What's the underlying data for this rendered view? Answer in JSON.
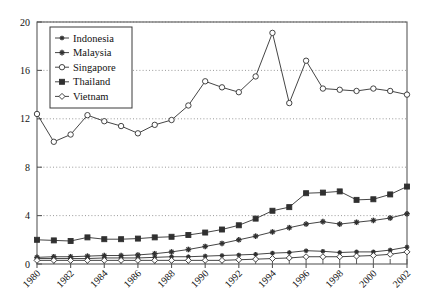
{
  "chart_data": {
    "type": "line",
    "title": "",
    "xlabel": "",
    "ylabel": "",
    "xlim": [
      1980,
      2002
    ],
    "ylim": [
      0,
      20
    ],
    "grid": true,
    "grid_axis": "y",
    "legend_position": "top-left",
    "x": [
      1980,
      1981,
      1982,
      1983,
      1984,
      1985,
      1986,
      1987,
      1988,
      1989,
      1990,
      1991,
      1992,
      1993,
      1994,
      1995,
      1996,
      1997,
      1998,
      1999,
      2000,
      2001,
      2002
    ],
    "xticks": [
      1980,
      1982,
      1984,
      1986,
      1988,
      1990,
      1992,
      1994,
      1996,
      1998,
      2000,
      2002
    ],
    "xtick_labels": [
      "1980",
      "1982",
      "1984",
      "1986",
      "1988",
      "1990",
      "1992",
      "1994",
      "1996",
      "1998",
      "2000",
      "2002"
    ],
    "yticks": [
      0,
      4,
      8,
      12,
      16,
      20
    ],
    "ytick_labels": [
      "0",
      "4",
      "8",
      "12",
      "16",
      "20"
    ],
    "series": [
      {
        "name": "Indonesia",
        "marker": "star-small",
        "fill": "solid",
        "values": [
          0.45,
          0.45,
          0.45,
          0.45,
          0.5,
          0.5,
          0.5,
          0.55,
          0.6,
          0.6,
          0.65,
          0.7,
          0.75,
          0.8,
          0.9,
          0.95,
          1.1,
          1.05,
          0.95,
          1.0,
          1.0,
          1.15,
          1.4
        ]
      },
      {
        "name": "Malaysia",
        "marker": "star",
        "fill": "solid",
        "values": [
          0.55,
          0.6,
          0.6,
          0.65,
          0.7,
          0.7,
          0.75,
          0.85,
          1.0,
          1.2,
          1.45,
          1.7,
          2.0,
          2.3,
          2.65,
          3.0,
          3.3,
          3.5,
          3.3,
          3.45,
          3.6,
          3.8,
          4.15
        ]
      },
      {
        "name": "Singapore",
        "marker": "circle",
        "fill": "open",
        "values": [
          12.4,
          10.1,
          10.7,
          12.3,
          11.8,
          11.4,
          10.8,
          11.5,
          11.9,
          13.1,
          15.1,
          14.6,
          14.2,
          15.5,
          19.1,
          13.3,
          16.8,
          14.5,
          14.4,
          14.3,
          14.5,
          14.3,
          14.0
        ]
      },
      {
        "name": "Thailand",
        "marker": "square",
        "fill": "solid",
        "values": [
          2.0,
          1.95,
          1.9,
          2.2,
          2.05,
          2.05,
          2.1,
          2.2,
          2.25,
          2.4,
          2.6,
          2.85,
          3.2,
          3.75,
          4.4,
          4.7,
          5.85,
          5.9,
          6.0,
          5.3,
          5.35,
          5.75,
          6.4
        ]
      },
      {
        "name": "Vietnam",
        "marker": "diamond",
        "fill": "open",
        "values": [
          0.3,
          0.3,
          0.3,
          0.3,
          0.3,
          0.3,
          0.3,
          0.3,
          0.3,
          0.3,
          0.3,
          0.3,
          0.35,
          0.4,
          0.45,
          0.5,
          0.6,
          0.6,
          0.6,
          0.65,
          0.7,
          0.8,
          1.0
        ]
      }
    ]
  },
  "style": {
    "line_color": "#303030",
    "axis_color": "#5a5a5a",
    "grid_color": "#808080",
    "text_color": "#111111",
    "background": "#ffffff"
  }
}
